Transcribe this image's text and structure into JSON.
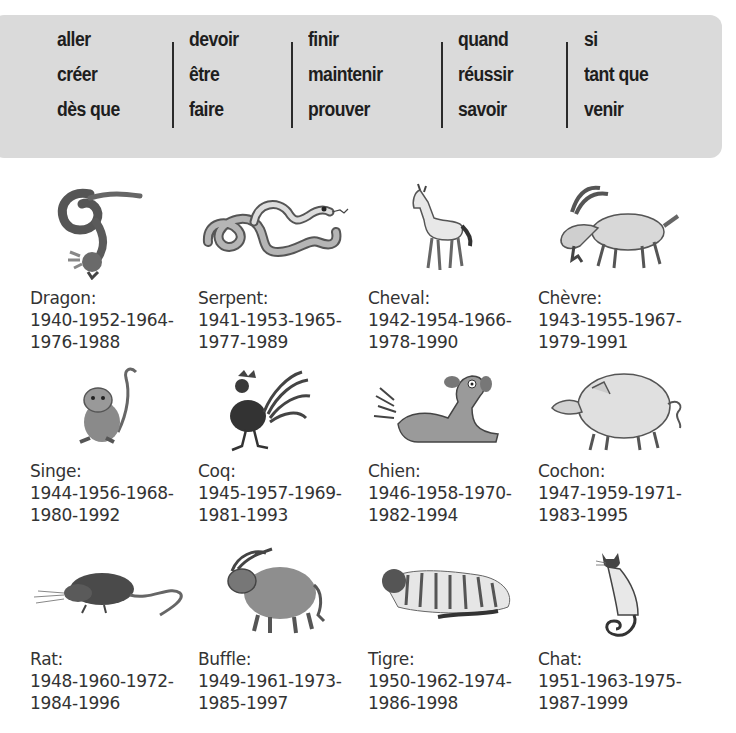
{
  "word_box": {
    "columns": [
      [
        "aller",
        "créer",
        "dès que"
      ],
      [
        "devoir",
        "être",
        "faire"
      ],
      [
        "finir",
        "maintenir",
        "prouver"
      ],
      [
        "quand",
        "réussir",
        "savoir"
      ],
      [
        "si",
        "tant que",
        "venir"
      ]
    ]
  },
  "animals": [
    {
      "name": "Dragon:",
      "years_line1": "1940-1952-1964-",
      "years_line2": "1976-1988",
      "icon": "dragon-icon"
    },
    {
      "name": "Serpent:",
      "years_line1": "1941-1953-1965-",
      "years_line2": "1977-1989",
      "icon": "snake-icon"
    },
    {
      "name": "Cheval:",
      "years_line1": "1942-1954-1966-",
      "years_line2": "1978-1990",
      "icon": "horse-icon"
    },
    {
      "name": "Chèvre:",
      "years_line1": "1943-1955-1967-",
      "years_line2": "1979-1991",
      "icon": "goat-icon"
    },
    {
      "name": "Singe:",
      "years_line1": "1944-1956-1968-",
      "years_line2": "1980-1992",
      "icon": "monkey-icon"
    },
    {
      "name": "Coq:",
      "years_line1": "1945-1957-1969-",
      "years_line2": "1981-1993",
      "icon": "rooster-icon"
    },
    {
      "name": "Chien:",
      "years_line1": "1946-1958-1970-",
      "years_line2": "1982-1994",
      "icon": "dog-icon"
    },
    {
      "name": "Cochon:",
      "years_line1": "1947-1959-1971-",
      "years_line2": "1983-1995",
      "icon": "pig-icon"
    },
    {
      "name": "Rat:",
      "years_line1": "1948-1960-1972-",
      "years_line2": "1984-1996",
      "icon": "rat-icon"
    },
    {
      "name": "Buffle:",
      "years_line1": "1949-1961-1973-",
      "years_line2": "1985-1997",
      "icon": "buffalo-icon"
    },
    {
      "name": "Tigre:",
      "years_line1": "1950-1962-1974-",
      "years_line2": "1986-1998",
      "icon": "tiger-icon"
    },
    {
      "name": "Chat:",
      "years_line1": "1951-1963-1975-",
      "years_line2": "1987-1999",
      "icon": "cat-icon"
    }
  ],
  "colors": {
    "box_background": "#dadada",
    "word_text": "#1e1e1e",
    "label_text": "#333333"
  }
}
